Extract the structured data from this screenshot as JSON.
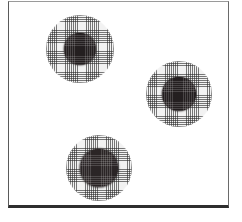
{
  "figure": {
    "name": "specimen-plate",
    "width": 242,
    "height": 222,
    "background_color": "#ffffff",
    "frame": {
      "color": "#5a5a5a",
      "bottom_rule_color": "#2e2e2e",
      "left": 8,
      "top": 1,
      "width": 221,
      "height": 207
    },
    "caption": "",
    "label": ""
  },
  "palette": {
    "halo_fill": "#f2f2f2",
    "halo_hatch": "#282828",
    "core_fill": "#241f20",
    "plate_background": "#ffffff"
  },
  "colonies": [
    {
      "id": "colony-1",
      "position": "upper-left",
      "cx": 79,
      "cy": 48,
      "halo_radius": 34,
      "core_radius": 16,
      "core_texture": "grid",
      "label": ""
    },
    {
      "id": "colony-2",
      "position": "middle-right",
      "cx": 178,
      "cy": 93,
      "halo_radius": 33,
      "core_radius": 17,
      "core_texture": "grid",
      "label": ""
    },
    {
      "id": "colony-3",
      "position": "lower-left",
      "cx": 98,
      "cy": 167,
      "halo_radius": 33,
      "core_radius": 19,
      "core_texture": "mottled",
      "label": ""
    }
  ]
}
